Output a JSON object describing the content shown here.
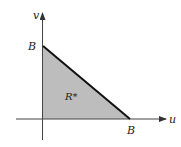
{
  "diagram": {
    "axes": {
      "horizontal_label": "u",
      "vertical_label": "v"
    },
    "region": {
      "label": "R*",
      "shape": "triangle",
      "vertices": [
        [
          0,
          0
        ],
        [
          1,
          0
        ],
        [
          0,
          1
        ]
      ],
      "fill": "#bdbdbd",
      "hypotenuse_color": "#111111"
    },
    "intercepts": {
      "u_intercept_label": "B",
      "v_intercept_label": "B"
    }
  }
}
